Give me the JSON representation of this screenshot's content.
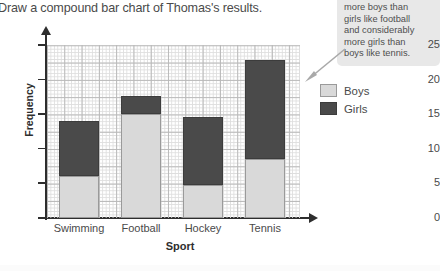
{
  "instruction": "Draw a compound bar chart of Thomas's results.",
  "callout": {
    "lines": [
      "more boys than",
      "girls like football",
      "and considerably",
      "more girls than",
      "boys like tennis."
    ],
    "arrow_icon": "arrow-up-right-icon",
    "background": "#e8e8e8"
  },
  "legend": {
    "position": "right",
    "entries": [
      {
        "label": "Boys",
        "color": "#d9d9d9"
      },
      {
        "label": "Girls",
        "color": "#4a4a4a"
      }
    ]
  },
  "chart_data": {
    "type": "bar",
    "stacked": true,
    "title": "",
    "xlabel": "Sport",
    "ylabel": "Frequency",
    "categories": [
      "Swimming",
      "Football",
      "Hockey",
      "Tennis"
    ],
    "series": [
      {
        "name": "Boys",
        "color": "#d9d9d9",
        "values": [
          6,
          15,
          4.8,
          8.5
        ]
      },
      {
        "name": "Girls",
        "color": "#4a4a4a",
        "values": [
          8,
          2.7,
          9.8,
          14.3
        ]
      }
    ],
    "totals": [
      14,
      17.7,
      14.6,
      22.8
    ],
    "ylim": [
      0,
      25
    ],
    "yticks": [
      0,
      5,
      10,
      15,
      20,
      25
    ],
    "grid": true,
    "grid_style": "graph-paper",
    "legend_position": "right"
  }
}
